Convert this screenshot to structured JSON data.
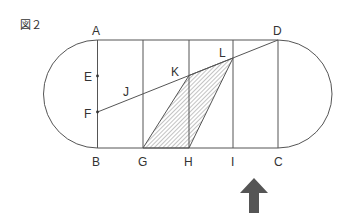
{
  "figure": {
    "caption": "図２",
    "colors": {
      "line": "#555555",
      "hatch": "#888888",
      "arrow": "#555555",
      "label": "#333333"
    }
  },
  "points": {
    "A": "A",
    "B": "B",
    "C": "C",
    "D": "D",
    "E": "E",
    "F": "F",
    "G": "G",
    "H": "H",
    "I": "I",
    "J": "J",
    "K": "K",
    "L": "L"
  },
  "shapes": {
    "track": "rectangle ABCD with semicircular ends on left and right",
    "vertical_divisions": [
      "AB",
      "G",
      "H",
      "I",
      "DC"
    ],
    "segment": "FD",
    "shaded_region": "quadrilateral G-K-L-H (hatched)",
    "arrow": "upward arrow below I–C"
  }
}
